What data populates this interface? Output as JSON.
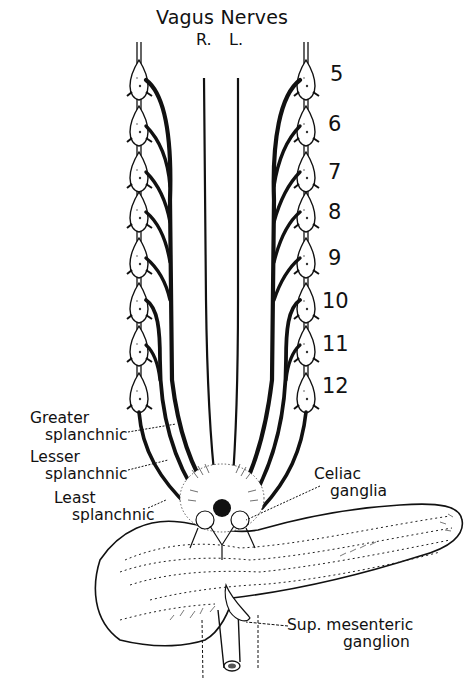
{
  "diagram": {
    "title": "Vagus Nerves",
    "vagus_sides": {
      "right": "R.",
      "left": "L."
    },
    "segments": [
      "5",
      "6",
      "7",
      "8",
      "9",
      "10",
      "11",
      "12"
    ],
    "labels": {
      "greater_splanchnic": [
        "Greater",
        "splanchnic"
      ],
      "lesser_splanchnic": [
        "Lesser",
        "splanchnic"
      ],
      "least_splanchnic": [
        "Least",
        "splanchnic"
      ],
      "celiac_ganglia": [
        "Celiac",
        "ganglia"
      ],
      "sup_mesenteric_ganglion": [
        "Sup. mesenteric",
        "ganglion"
      ]
    },
    "structures": [
      "sympathetic-chain-left",
      "sympathetic-chain-right",
      "right-vagus-nerve",
      "left-vagus-nerve",
      "celiac-ganglia",
      "pancreas",
      "superior-mesenteric-artery"
    ],
    "colors": {
      "ink": "#111111",
      "background": "#ffffff"
    }
  }
}
